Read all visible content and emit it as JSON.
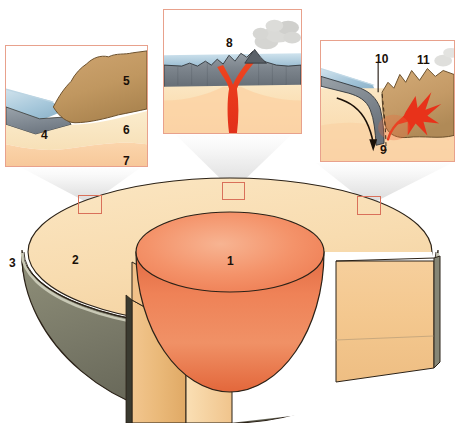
{
  "figure": {
    "width": 460,
    "height": 423
  },
  "colors": {
    "background": "#ffffff",
    "panel_border": "#e8a18c",
    "marker_border": "#d9705a",
    "core_light": "#f4a07a",
    "core_mid": "#ef7f53",
    "core_dark": "#e2673c",
    "mantle_top": "#fadfb4",
    "mantle_cut_light": "#f6cf9c",
    "mantle_cut_mid": "#edb877",
    "crust_shell": "#6d6d5c",
    "crust_shell_light": "#9a9a84",
    "oceanic_crust": "#8a939b",
    "continental_crust": "#c49a66",
    "upper_mantle": "#f8e2bb",
    "lower_mantle": "#f9cfa6",
    "ocean_water": "#9fc3d8",
    "magma_red": "#e8321a",
    "smoke_gray": "#b6b6b2",
    "cone_gray": "#e2e2e2",
    "outline": "#2b2218",
    "label_text": "#1a1008"
  },
  "earth": {
    "name": "earth-cutaway",
    "labels": [
      {
        "id": "label-1",
        "text": "1",
        "x": 227,
        "y": 255,
        "region": "core"
      },
      {
        "id": "label-2",
        "text": "2",
        "x": 72,
        "y": 254,
        "region": "mantle"
      },
      {
        "id": "label-3",
        "text": "3",
        "x": 9,
        "y": 257,
        "region": "crust"
      }
    ],
    "markers": [
      {
        "id": "marker-left",
        "x": 78,
        "y": 195,
        "w": 24,
        "h": 19
      },
      {
        "id": "marker-middle",
        "x": 222,
        "y": 182,
        "w": 23,
        "h": 18
      },
      {
        "id": "marker-right",
        "x": 357,
        "y": 196,
        "w": 24,
        "h": 19
      }
    ]
  },
  "panels": [
    {
      "id": "panel-left",
      "name": "callout-panel-continental-margin",
      "x": 5,
      "y": 45,
      "w": 143,
      "h": 122,
      "labels": [
        {
          "id": "label-4",
          "text": "4",
          "x": 36,
          "y": 84,
          "size": "sz-panel"
        },
        {
          "id": "label-5",
          "text": "5",
          "x": 118,
          "y": 30,
          "size": "sz-panel"
        },
        {
          "id": "label-6",
          "text": "6",
          "x": 118,
          "y": 79,
          "size": "sz-panel"
        },
        {
          "id": "label-7",
          "text": "7",
          "x": 118,
          "y": 110,
          "size": "sz-panel"
        }
      ]
    },
    {
      "id": "panel-middle",
      "name": "callout-panel-volcano",
      "x": 163,
      "y": 9,
      "w": 139,
      "h": 125,
      "labels": [
        {
          "id": "label-8",
          "text": "8",
          "x": 63,
          "y": 28,
          "size": "sz-panel"
        }
      ]
    },
    {
      "id": "panel-right",
      "name": "callout-panel-subduction-zone",
      "x": 320,
      "y": 40,
      "w": 135,
      "h": 122,
      "labels": [
        {
          "id": "label-10",
          "text": "10",
          "x": 55,
          "y": 13,
          "size": "sz-panel"
        },
        {
          "id": "label-11",
          "text": "11",
          "x": 97,
          "y": 14,
          "size": "sz-panel"
        },
        {
          "id": "label-9",
          "text": "9",
          "x": 60,
          "y": 104,
          "size": "sz-panel"
        }
      ]
    }
  ],
  "cones": [
    {
      "id": "cone-left",
      "apex_x": 90,
      "apex_y": 204,
      "left_x": 22,
      "right_x": 140,
      "top_y": 168
    },
    {
      "id": "cone-middle",
      "apex_x": 233,
      "apex_y": 191,
      "left_x": 176,
      "right_x": 291,
      "top_y": 135
    },
    {
      "id": "cone-right",
      "apex_x": 369,
      "apex_y": 205,
      "left_x": 316,
      "right_x": 452,
      "top_y": 163
    }
  ]
}
